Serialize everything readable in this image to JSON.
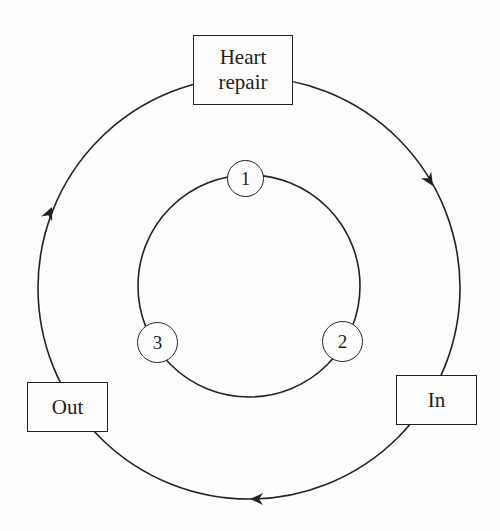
{
  "diagram": {
    "type": "cycle",
    "outer_cycle": {
      "direction": "clockwise",
      "stages": [
        {
          "id": "heart_repair",
          "lines": [
            "Heart",
            "repair"
          ]
        },
        {
          "id": "in",
          "lines": [
            "In"
          ]
        },
        {
          "id": "out",
          "lines": [
            "Out"
          ]
        }
      ]
    },
    "inner_cycle": {
      "nodes": [
        {
          "id": "node_1",
          "label": "1"
        },
        {
          "id": "node_2",
          "label": "2"
        },
        {
          "id": "node_3",
          "label": "3"
        }
      ]
    },
    "arrows": [
      {
        "id": "arrow_heart_to_in",
        "from": "Heart repair",
        "to": "In"
      },
      {
        "id": "arrow_in_to_out",
        "from": "In",
        "to": "Out"
      },
      {
        "id": "arrow_out_to_heart",
        "from": "Out",
        "to": "Heart repair"
      }
    ],
    "colors": {
      "line": "#222222",
      "background": "#fdfdfc"
    }
  }
}
